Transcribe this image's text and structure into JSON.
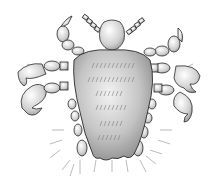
{
  "illustration": {
    "subject": "crab louse",
    "colors": {
      "background": "#ffffff",
      "body_light": "#e8e8e8",
      "body_mid": "#bdbdbd",
      "body_dark": "#8a8a8a",
      "outline": "#2a2a2a",
      "hair": "#8c8c8c"
    }
  }
}
